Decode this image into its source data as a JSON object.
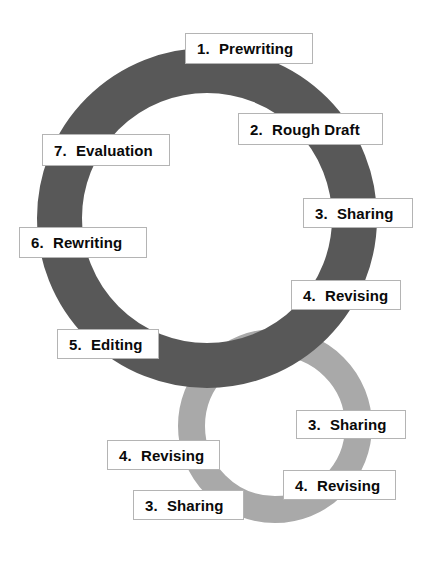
{
  "diagram": {
    "background_color": "#ffffff",
    "rings": [
      {
        "name": "primary-cycle-ring",
        "color": "#585858",
        "cx": 207,
        "cy": 218,
        "outer_radius": 170,
        "thickness": 45
      },
      {
        "name": "secondary-cycle-ring",
        "color": "#a9a9a9",
        "cx": 275,
        "cy": 426,
        "outer_radius": 97,
        "thickness": 27
      }
    ],
    "labels": [
      {
        "id": "prewriting",
        "number": "1.",
        "text": "Prewriting",
        "ring": "primary",
        "x": 185,
        "y": 33,
        "w": 128,
        "h": 31
      },
      {
        "id": "rough-draft",
        "number": "2.",
        "text": "Rough Draft",
        "ring": "primary",
        "x": 238,
        "y": 113,
        "w": 145,
        "h": 32
      },
      {
        "id": "evaluation",
        "number": "7.",
        "text": "Evaluation",
        "ring": "primary",
        "x": 42,
        "y": 134,
        "w": 128,
        "h": 32
      },
      {
        "id": "sharing-upper",
        "number": "3.",
        "text": "Sharing",
        "ring": "primary",
        "x": 303,
        "y": 198,
        "w": 110,
        "h": 30
      },
      {
        "id": "rewriting",
        "number": "6.",
        "text": "Rewriting",
        "ring": "primary",
        "x": 19,
        "y": 227,
        "w": 128,
        "h": 31
      },
      {
        "id": "revising-upper",
        "number": "4.",
        "text": "Revising",
        "ring": "primary",
        "x": 291,
        "y": 280,
        "w": 110,
        "h": 30
      },
      {
        "id": "editing",
        "number": "5.",
        "text": "Editing",
        "ring": "primary",
        "x": 57,
        "y": 329,
        "w": 102,
        "h": 30
      },
      {
        "id": "sharing-lower-right",
        "number": "3.",
        "text": "Sharing",
        "ring": "secondary",
        "x": 296,
        "y": 410,
        "w": 110,
        "h": 29
      },
      {
        "id": "revising-lower-left",
        "number": "4.",
        "text": "Revising",
        "ring": "secondary",
        "x": 107,
        "y": 440,
        "w": 113,
        "h": 30
      },
      {
        "id": "revising-lower-right",
        "number": "4.",
        "text": "Revising",
        "ring": "secondary",
        "x": 283,
        "y": 470,
        "w": 113,
        "h": 30
      },
      {
        "id": "sharing-bottom",
        "number": "3.",
        "text": "Sharing",
        "ring": "secondary",
        "x": 133,
        "y": 490,
        "w": 111,
        "h": 30
      }
    ]
  }
}
